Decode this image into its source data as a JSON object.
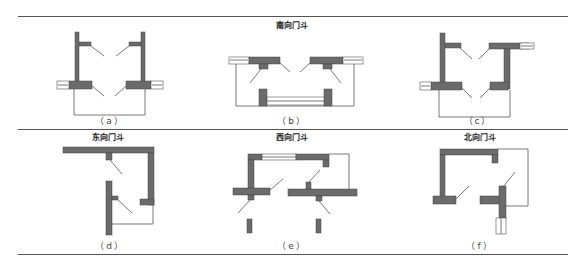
{
  "figure": {
    "colors": {
      "wall": "#6b6b6b",
      "wall_stroke": "#444444",
      "line": "#555555",
      "rule": "#555555",
      "window_fill": "#ffffff"
    },
    "group_titles": [
      {
        "id": "south",
        "label": "南向门斗"
      },
      {
        "id": "east",
        "label": "东向门斗"
      },
      {
        "id": "west",
        "label": "西向门斗"
      },
      {
        "id": "north",
        "label": "北向门斗"
      }
    ],
    "panels": [
      {
        "id": "a",
        "caption": "（a）",
        "group": "南向门斗"
      },
      {
        "id": "b",
        "caption": "（b）",
        "group": "南向门斗"
      },
      {
        "id": "c",
        "caption": "（c）",
        "group": "南向门斗"
      },
      {
        "id": "d",
        "caption": "（d）",
        "group": "东向门斗"
      },
      {
        "id": "e",
        "caption": "（e）",
        "group": "西向门斗"
      },
      {
        "id": "f",
        "caption": "（f）",
        "group": "北向门斗"
      }
    ]
  }
}
